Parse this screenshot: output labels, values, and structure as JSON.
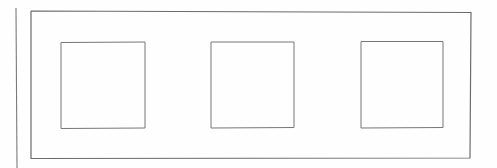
{
  "document": {
    "kind": "line-drawing",
    "title": "Rectangular frame elevation with three square panels",
    "canvas": {
      "width": 497,
      "height": 168
    },
    "background_color": "#fefefe",
    "stroke_color": "#6b6b6b",
    "stroke_color_light": "#8d8d8d",
    "stroke_width": 1.1,
    "label_text": ""
  },
  "shapes": {
    "left_edge_line": {
      "name": "left vertical edge line",
      "x1": 16,
      "y1": 8,
      "x2": 17,
      "y2": 168,
      "stroke": "#7a7a7a",
      "stroke_width": 1.1
    },
    "outer_frame": {
      "name": "outer rectangle frame",
      "points": "31,11 471,12.5 470,158 31,158.5 31,11",
      "stroke": "#6b6b6b",
      "stroke_width": 1.2,
      "fill": "none"
    },
    "panels": [
      {
        "name": "panel-1",
        "points": "61,42.5 145,42 145,128 61,128.5 61,42.5",
        "stroke": "#777777",
        "stroke_width": 1.0,
        "fill": "none",
        "x": 61,
        "y": 42,
        "width": 84,
        "height": 86
      },
      {
        "name": "panel-2",
        "points": "211,42 294,42 294,127.5 211,128 211,42",
        "stroke": "#777777",
        "stroke_width": 1.0,
        "fill": "none",
        "x": 211,
        "y": 42,
        "width": 83,
        "height": 86
      },
      {
        "name": "panel-3",
        "points": "361,41.5 443,41.5 443,127.5 361,128 361,41.5",
        "stroke": "#777777",
        "stroke_width": 1.0,
        "fill": "none",
        "x": 361,
        "y": 41,
        "width": 82,
        "height": 86
      }
    ]
  },
  "measurements": {
    "outer_frame_width_px": 440,
    "outer_frame_height_px": 147,
    "panel_count": 3,
    "panel_gap_px": 66,
    "left_margin_px": 31,
    "top_margin_px": 11
  }
}
